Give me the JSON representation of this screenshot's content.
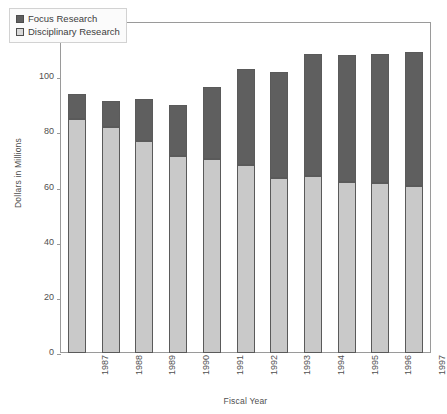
{
  "chart_data": {
    "type": "bar",
    "stacked": true,
    "title": "",
    "xlabel": "Fiscal Year",
    "ylabel": "Dollars in Millions",
    "categories": [
      "1987",
      "1988",
      "1989",
      "1990",
      "1991",
      "1992",
      "1993",
      "1994",
      "1995",
      "1996",
      "1997"
    ],
    "series": [
      {
        "name": "Disciplinary Research",
        "color": "#c9c9c9",
        "values": [
          85,
          82,
          77,
          71.5,
          70.5,
          68,
          63.5,
          64,
          62,
          61.5,
          60.5
        ]
      },
      {
        "name": "Focus Research",
        "color": "#5f5f5f",
        "values": [
          9,
          9.5,
          15,
          18.5,
          26,
          35,
          38.5,
          44.5,
          46,
          47,
          48.5
        ]
      }
    ],
    "totals": [
      94,
      91.5,
      92,
      90,
      96.5,
      103,
      102,
      108.5,
      108,
      108.5,
      109
    ],
    "stack_order": [
      "Disciplinary Research",
      "Focus Research"
    ],
    "ylim": [
      0,
      120
    ],
    "yticks": [
      0,
      20,
      40,
      60,
      80,
      100,
      120
    ],
    "ytick_labels": [
      "0",
      "20",
      "40",
      "60",
      "80",
      "100",
      "120"
    ],
    "grid": false,
    "legend_position": "top-left",
    "legend_entries": [
      {
        "label": "Focus Research",
        "swatch": "#5f5f5f"
      },
      {
        "label": "Disciplinary Research",
        "swatch": "#d8d8d8"
      }
    ]
  }
}
